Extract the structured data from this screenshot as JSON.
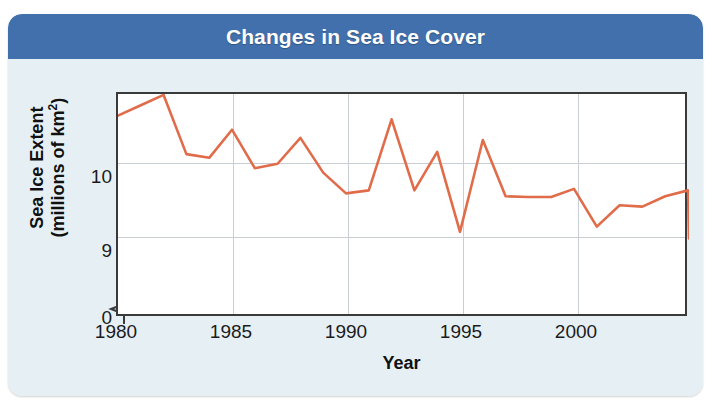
{
  "figure": {
    "title": "Changes in Sea Ice Cover",
    "header_color": "#4170ac",
    "panel_color": "#e6f0f4",
    "line_color": "#e06c4a"
  },
  "axes": {
    "ylabel_line1": "Sea Ice Extent",
    "ylabel_line2_pre": "(millions of km",
    "ylabel_line2_sup": "2",
    "ylabel_line2_post": ")",
    "xlabel": "Year",
    "y_ticks": [
      "10",
      "9",
      "0"
    ],
    "x_ticks": [
      "1980",
      "1985",
      "1990",
      "1995",
      "2000"
    ],
    "axis_break": "yes"
  },
  "chart_data": {
    "type": "line",
    "title": "Changes in Sea Ice Cover",
    "xlabel": "Year",
    "ylabel": "Sea Ice Extent (millions of km2)",
    "xlim": [
      1980,
      2005
    ],
    "ylim": [
      8.75,
      11.0
    ],
    "ytick_values": [
      10,
      9,
      0
    ],
    "xtick_values": [
      1980,
      1985,
      1990,
      1995,
      2000
    ],
    "grid": true,
    "legend": "none",
    "axis_break_below": 8.75,
    "line_color": "#e06c4a",
    "x": [
      1980,
      1981,
      1982,
      1983,
      1984,
      1985,
      1986,
      1987,
      1988,
      1989,
      1990,
      1991,
      1992,
      1993,
      1994,
      1995,
      1996,
      1997,
      1998,
      1999,
      2000,
      2001,
      2002,
      2003,
      2004,
      2005
    ],
    "values": [
      10.64,
      10.78,
      10.92,
      10.12,
      10.07,
      10.45,
      9.93,
      9.99,
      10.34,
      9.87,
      9.59,
      9.63,
      10.59,
      9.63,
      10.15,
      9.07,
      10.31,
      9.55,
      9.54,
      9.54,
      9.65,
      9.14,
      9.43,
      9.41,
      9.55,
      9.63
    ],
    "final_value": 8.98,
    "series": [
      {
        "name": "Sea Ice Extent",
        "values": [
          10.64,
          10.78,
          10.92,
          10.12,
          10.07,
          10.45,
          9.93,
          9.99,
          10.34,
          9.87,
          9.59,
          9.63,
          10.59,
          9.63,
          10.15,
          9.07,
          10.31,
          9.55,
          9.54,
          9.54,
          9.65,
          9.14,
          9.43,
          9.41,
          9.55,
          9.63
        ]
      }
    ]
  }
}
